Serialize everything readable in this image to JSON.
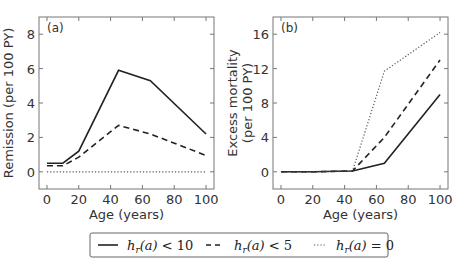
{
  "chart_data": [
    {
      "type": "line",
      "panel_label": "(a)",
      "title": "",
      "xlabel": "Age (years)",
      "ylabel": "Remission (per 100 PY)",
      "xlim": [
        -5,
        105
      ],
      "ylim": [
        -1,
        9
      ],
      "xticks": [
        0,
        20,
        40,
        60,
        80,
        100
      ],
      "yticks": [
        0,
        2,
        4,
        6,
        8
      ],
      "grid": false,
      "series": [
        {
          "name": "h_r(a) < 10",
          "style": "solid",
          "x": [
            0,
            10,
            20,
            45,
            65,
            100
          ],
          "y": [
            0.5,
            0.5,
            1.2,
            5.9,
            5.3,
            2.2
          ]
        },
        {
          "name": "h_r(a) < 5",
          "style": "dashed",
          "x": [
            0,
            10,
            20,
            45,
            65,
            100
          ],
          "y": [
            0.35,
            0.35,
            0.85,
            2.7,
            2.2,
            0.95
          ]
        },
        {
          "name": "h_r(a) = 0",
          "style": "dotted",
          "x": [
            0,
            10,
            20,
            45,
            65,
            100
          ],
          "y": [
            0,
            0,
            0,
            0,
            0,
            0
          ]
        }
      ]
    },
    {
      "type": "line",
      "panel_label": "(b)",
      "title": "",
      "xlabel": "Age (years)",
      "ylabel": "Excess mortality (per 100 PY)",
      "ylabel_lines": [
        "Excess mortality",
        "(per 100 PY)"
      ],
      "xlim": [
        -5,
        105
      ],
      "ylim": [
        -2,
        18
      ],
      "xticks": [
        0,
        20,
        40,
        60,
        80,
        100
      ],
      "yticks": [
        0,
        4,
        8,
        12,
        16
      ],
      "grid": false,
      "series": [
        {
          "name": "h_r(a) < 10",
          "style": "solid",
          "x": [
            0,
            10,
            20,
            45,
            65,
            100
          ],
          "y": [
            0,
            0,
            0,
            0.1,
            1.0,
            9.0
          ]
        },
        {
          "name": "h_r(a) < 5",
          "style": "dashed",
          "x": [
            0,
            10,
            20,
            45,
            65,
            100
          ],
          "y": [
            0,
            0,
            0,
            0.1,
            4.0,
            13.0
          ]
        },
        {
          "name": "h_r(a) = 0",
          "style": "dotted",
          "x": [
            0,
            10,
            20,
            45,
            65,
            100
          ],
          "y": [
            0,
            0,
            0,
            0.1,
            11.7,
            16.2
          ]
        }
      ]
    }
  ],
  "legend": {
    "position": "bottom-center",
    "entries": [
      {
        "label_text": "h_r(a) < 10",
        "style": "solid"
      },
      {
        "label_text": "h_r(a) < 5",
        "style": "dashed"
      },
      {
        "label_text": "h_r(a) = 0",
        "style": "dotted"
      }
    ]
  },
  "colors": {
    "line": "#222222",
    "dotted": "#555555",
    "axes": "#777777",
    "text": "#333333"
  }
}
